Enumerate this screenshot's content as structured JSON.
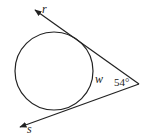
{
  "diagram": {
    "type": "circle with two tangent rays",
    "labels": {
      "ray_top": "r",
      "ray_bottom": "s",
      "arc": "w",
      "angle": "54°"
    },
    "stroke_color": "#222222"
  }
}
